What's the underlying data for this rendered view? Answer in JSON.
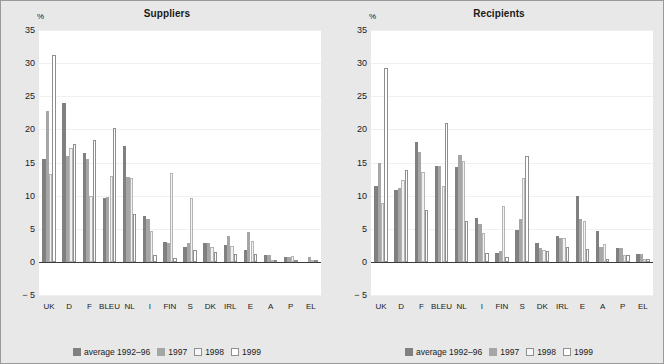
{
  "chart_data": [
    {
      "type": "bar",
      "title": "Suppliers",
      "ylabel": "%",
      "xlabel": "",
      "ylim": [
        -5,
        35
      ],
      "yticks": [
        35,
        30,
        25,
        20,
        15,
        10,
        5,
        0,
        -5
      ],
      "ytick_labels": [
        "35",
        "30",
        "25",
        "20",
        "15",
        "10",
        "5",
        "0",
        "− 5"
      ],
      "grid": true,
      "legend_position": "bottom",
      "categories": [
        "UK",
        "D",
        "F",
        "BLEU",
        "NL",
        "I",
        "FIN",
        "S",
        "DK",
        "IRL",
        "E",
        "A",
        "P",
        "EL"
      ],
      "series": [
        {
          "name": "average 1992–96",
          "color": "#808080",
          "values": [
            15.6,
            24.0,
            16.5,
            9.6,
            17.5,
            6.9,
            3.0,
            2.3,
            2.8,
            2.6,
            1.8,
            1.1,
            0.8,
            0.0
          ]
        },
        {
          "name": "1997",
          "color": "#a6a6a6",
          "values": [
            22.8,
            16.0,
            15.6,
            9.8,
            12.8,
            6.5,
            2.9,
            2.8,
            2.8,
            3.9,
            4.5,
            1.1,
            0.8,
            0.7
          ]
        },
        {
          "name": "1998",
          "color": "#f2f2f2",
          "values": [
            13.3,
            17.2,
            9.9,
            13.0,
            12.6,
            4.7,
            13.4,
            9.6,
            2.2,
            2.4,
            3.2,
            0.0,
            0.9,
            0.0
          ]
        },
        {
          "name": "1999",
          "color": "#ffffff",
          "values": [
            31.2,
            17.8,
            18.4,
            20.2,
            7.2,
            1.1,
            0.6,
            1.8,
            1.5,
            1.2,
            1.2,
            0.0,
            0.1,
            0.2
          ]
        }
      ]
    },
    {
      "type": "bar",
      "title": "Recipients",
      "ylabel": "%",
      "xlabel": "",
      "ylim": [
        -5,
        35
      ],
      "yticks": [
        35,
        30,
        25,
        20,
        15,
        10,
        5,
        0,
        -5
      ],
      "ytick_labels": [
        "35",
        "30",
        "25",
        "20",
        "15",
        "10",
        "5",
        "0",
        "− 5"
      ],
      "grid": true,
      "legend_position": "bottom",
      "categories": [
        "UK",
        "D",
        "F",
        "BLEU",
        "NL",
        "I",
        "FIN",
        "S",
        "DK",
        "IRL",
        "E",
        "A",
        "P",
        "EL"
      ],
      "series": [
        {
          "name": "average 1992–96",
          "color": "#808080",
          "values": [
            11.4,
            10.9,
            18.1,
            14.5,
            14.3,
            6.7,
            1.4,
            4.8,
            2.8,
            3.9,
            10.0,
            4.6,
            2.1,
            1.2
          ]
        },
        {
          "name": "1997",
          "color": "#a6a6a6",
          "values": [
            15.0,
            11.1,
            16.6,
            14.4,
            16.1,
            5.7,
            1.6,
            6.5,
            2.1,
            3.6,
            6.4,
            2.3,
            2.1,
            1.2
          ]
        },
        {
          "name": "1998",
          "color": "#f2f2f2",
          "values": [
            8.9,
            12.3,
            13.6,
            11.5,
            15.2,
            4.3,
            8.5,
            12.6,
            1.8,
            3.6,
            6.2,
            2.7,
            1.0,
            0.5
          ]
        },
        {
          "name": "1999",
          "color": "#ffffff",
          "values": [
            29.2,
            13.9,
            7.9,
            20.9,
            6.2,
            1.4,
            0.7,
            16.0,
            1.6,
            2.2,
            2.0,
            0.5,
            1.0,
            0.5
          ]
        }
      ]
    }
  ],
  "legend": {
    "items": [
      {
        "label": "average 1992–96"
      },
      {
        "label": "1997"
      },
      {
        "label": "1998"
      },
      {
        "label": "1999"
      }
    ]
  }
}
